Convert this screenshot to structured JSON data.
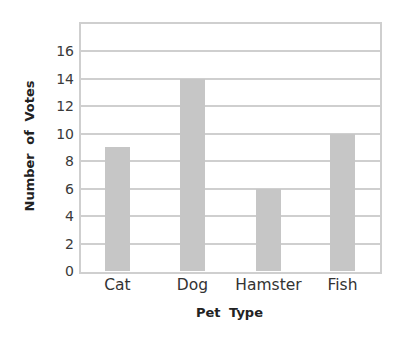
{
  "chart_data": {
    "type": "bar",
    "title": "",
    "categories": [
      "Cat",
      "Dog",
      "Hamster",
      "Fish"
    ],
    "values": [
      9,
      14,
      6,
      10
    ],
    "xlabel": "Pet Type",
    "ylabel": "Number of Votes",
    "ylim": [
      0,
      18
    ],
    "yticks": [
      0,
      2,
      4,
      6,
      8,
      10,
      12,
      14,
      16
    ],
    "grid": true,
    "legend": null,
    "bar_color": "#c6c6c6",
    "grid_color": "#cfcfcf"
  },
  "axes": {
    "x_title": "Pet Type",
    "y_title": "Number of Votes",
    "y_tick_labels": [
      "0",
      "2",
      "4",
      "6",
      "8",
      "10",
      "12",
      "14",
      "16"
    ],
    "x_tick_labels": [
      "Cat",
      "Dog",
      "Hamster",
      "Fish"
    ]
  }
}
